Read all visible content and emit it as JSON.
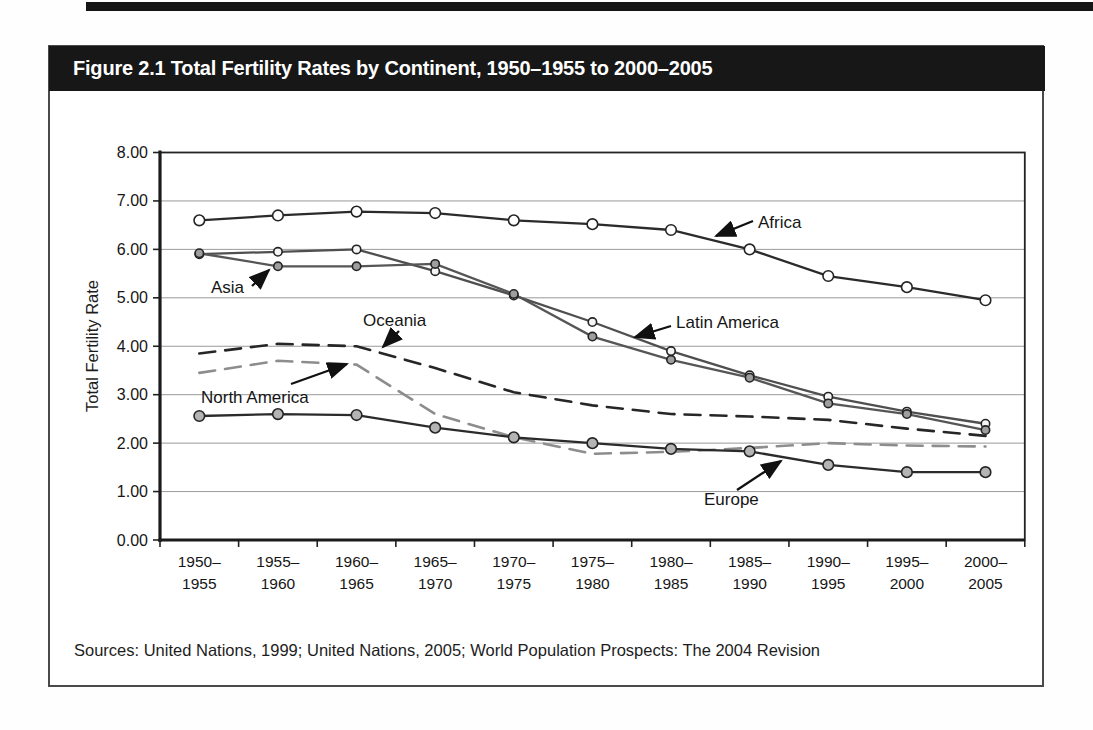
{
  "figure": {
    "title": "Figure 2.1 Total Fertility Rates by Continent, 1950–1955 to 2000–2005",
    "sources": "Sources: United Nations, 1999; United Nations, 2005; World Population Prospects: The 2004 Revision"
  },
  "chart_data": {
    "type": "line",
    "title": "Figure 2.1 Total Fertility Rates by Continent, 1950–1955 to 2000–2005",
    "xlabel": "",
    "ylabel": "Total Fertility Rate",
    "ylim": [
      0,
      8
    ],
    "ytick_step": 1,
    "ytick_labels": [
      "0.00",
      "1.00",
      "2.00",
      "3.00",
      "4.00",
      "5.00",
      "6.00",
      "7.00",
      "8.00"
    ],
    "grid": true,
    "legend_position": "inline-annotations",
    "categories": [
      "1950–1955",
      "1955–1960",
      "1960–1965",
      "1965–1970",
      "1970–1975",
      "1975–1980",
      "1980–1985",
      "1985–1990",
      "1990–1995",
      "1995–2000",
      "2000–2005"
    ],
    "series": [
      {
        "name": "North America",
        "values": [
          3.45,
          3.7,
          3.62,
          2.6,
          2.12,
          1.78,
          1.82,
          1.9,
          2.0,
          1.95,
          1.93
        ],
        "color": "#8d8d8d",
        "dash": "long-dash",
        "marker": "none",
        "marker_size": "none",
        "marker_fill": ""
      },
      {
        "name": "Oceania",
        "values": [
          3.85,
          4.05,
          4.0,
          3.55,
          3.05,
          2.78,
          2.6,
          2.55,
          2.48,
          2.3,
          2.15
        ],
        "color": "#262626",
        "dash": "long-dash",
        "marker": "none",
        "marker_size": "none",
        "marker_fill": ""
      },
      {
        "name": "Latin America",
        "values": [
          5.9,
          5.95,
          6.0,
          5.55,
          5.05,
          4.5,
          3.9,
          3.4,
          2.96,
          2.65,
          2.4
        ],
        "color": "#4f4f4f",
        "dash": "solid",
        "marker": "circle-open",
        "marker_size": "small",
        "marker_fill": "#f5f5f5"
      },
      {
        "name": "Asia",
        "values": [
          5.92,
          5.65,
          5.65,
          5.7,
          5.08,
          4.2,
          3.72,
          3.35,
          2.82,
          2.6,
          2.27
        ],
        "color": "#565656",
        "dash": "solid",
        "marker": "circle-filled",
        "marker_size": "small",
        "marker_fill": "#9e9e9e"
      },
      {
        "name": "Africa",
        "values": [
          6.6,
          6.7,
          6.78,
          6.75,
          6.6,
          6.52,
          6.4,
          6.0,
          5.45,
          5.22,
          4.95
        ],
        "color": "#2b2b2b",
        "dash": "solid",
        "marker": "circle-open",
        "marker_size": "large",
        "marker_fill": "#ffffff"
      },
      {
        "name": "Europe",
        "values": [
          2.56,
          2.6,
          2.58,
          2.32,
          2.12,
          2.0,
          1.88,
          1.83,
          1.55,
          1.4,
          1.4
        ],
        "color": "#2b2b2b",
        "dash": "solid",
        "marker": "circle-filled",
        "marker_size": "large",
        "marker_fill": "#b4b4b4"
      }
    ],
    "annotations": [
      "Africa",
      "Asia",
      "Oceania",
      "North America",
      "Latin America",
      "Europe"
    ]
  }
}
